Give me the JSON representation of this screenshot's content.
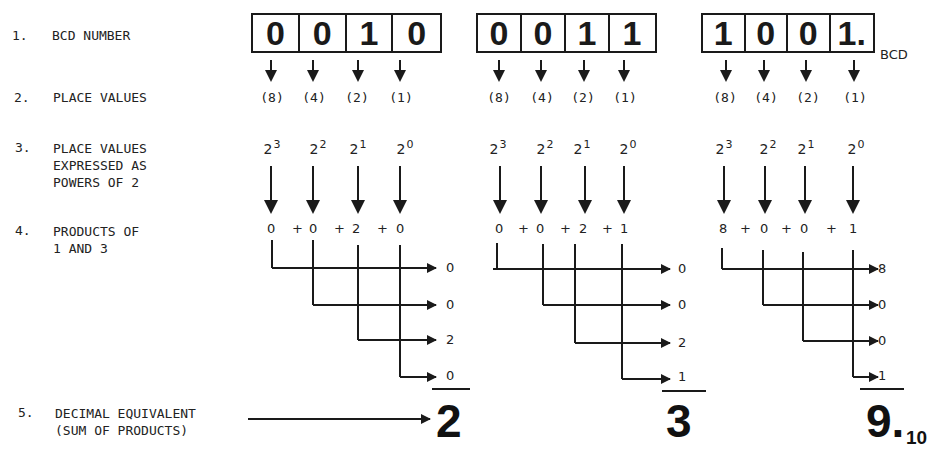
{
  "steps": [
    {
      "num": "1.",
      "label": "BCD NUMBER"
    },
    {
      "num": "2.",
      "label": "PLACE VALUES"
    },
    {
      "num": "3.",
      "label": "PLACE VALUES\nEXPRESSED AS\nPOWERS OF 2"
    },
    {
      "num": "4.",
      "label": "PRODUCTS OF\n1 AND 3"
    },
    {
      "num": "5.",
      "label": "DECIMAL EQUIVALENT\n(SUM OF PRODUCTS)"
    }
  ],
  "place_values": [
    "(8)",
    "(4)",
    "(2)",
    "(1)"
  ],
  "powers": [
    {
      "base": "2",
      "exp": "3"
    },
    {
      "base": "2",
      "exp": "2"
    },
    {
      "base": "2",
      "exp": "1"
    },
    {
      "base": "2",
      "exp": "0"
    }
  ],
  "examples": [
    {
      "bits": [
        "0",
        "0",
        "1",
        "0"
      ],
      "products": [
        "0",
        "+",
        "0",
        "+",
        "2",
        "+",
        "0"
      ],
      "results": [
        "0",
        "0",
        "2",
        "0"
      ],
      "sum": "2"
    },
    {
      "bits": [
        "0",
        "0",
        "1",
        "1"
      ],
      "products": [
        "0",
        "+",
        "0",
        "+",
        "2",
        "+",
        "1"
      ],
      "results": [
        "0",
        "0",
        "2",
        "1"
      ],
      "sum": "3"
    },
    {
      "bits": [
        "1",
        "0",
        "0",
        "1."
      ],
      "bcd_tag": "BCD",
      "products": [
        "8",
        "+",
        "0",
        "+",
        "0",
        "+",
        "1"
      ],
      "results": [
        "8",
        "0",
        "0",
        "1"
      ],
      "sum": "9.",
      "sum_subscript": "10"
    }
  ]
}
